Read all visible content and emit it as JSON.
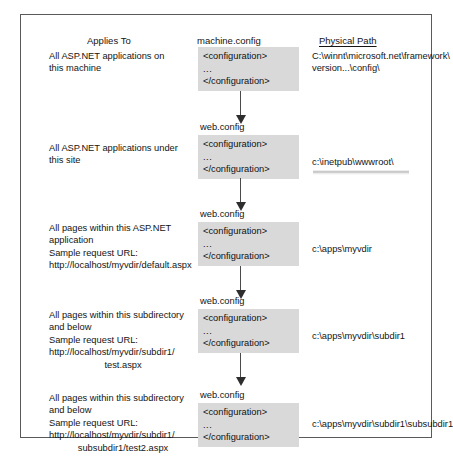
{
  "figure": {
    "headers": {
      "applies_to": "Applies To",
      "machine_config": "machine.config",
      "physical_path": "Physical Path"
    },
    "config_block": {
      "open_tag": "<configuration>",
      "ellipsis": "...",
      "close_tag": "</configuration>"
    },
    "rows": [
      {
        "applies_to_lines": [
          "All ASP.NET applications on",
          "this machine"
        ],
        "config_label": "machine.config",
        "path_lines": [
          "C:\\winnt\\microsoft.net\\framework\\",
          "version...\\config\\"
        ],
        "has_smudge": false
      },
      {
        "applies_to_lines": [
          "All ASP.NET applications under",
          "this site"
        ],
        "config_label": "web.config",
        "path_lines": [
          "c:\\inetpub\\wwwroot\\"
        ],
        "has_smudge": true
      },
      {
        "applies_to_lines": [
          "All pages within this ASP.NET",
          "application",
          "Sample request URL:",
          "http://localhost/myvdir/default.aspx"
        ],
        "config_label": "web.config",
        "path_lines": [
          "c:\\apps\\myvdir"
        ],
        "has_smudge": false
      },
      {
        "applies_to_lines": [
          "All pages within this subdirectory",
          "and below",
          "Sample request URL:",
          "http://localhost/myvdir/subdir1/",
          "test.aspx"
        ],
        "config_label": "web.config",
        "path_lines": [
          "c:\\apps\\myvdir\\subdir1"
        ],
        "has_smudge": false
      },
      {
        "applies_to_lines": [
          "All pages within this subdirectory",
          "and below",
          "Sample request URL:",
          "http://localhost/myvdir/subdir1/",
          "subsubdir1/test2.aspx"
        ],
        "config_label": "web.config",
        "path_lines": [
          "c:\\apps\\myvdir\\subdir1\\subsubdir1"
        ],
        "has_smudge": false
      }
    ],
    "arrows": [
      {
        "name": "arrow-machine-to-site"
      },
      {
        "name": "arrow-site-to-app"
      },
      {
        "name": "arrow-app-to-subdir"
      },
      {
        "name": "arrow-subdir-to-subsubdir"
      }
    ],
    "colors": {
      "config_block_bg": "#d9d9d9",
      "frame_border": "#5a5a5a",
      "text": "#141414",
      "arrow": "#2e2e2e"
    }
  }
}
